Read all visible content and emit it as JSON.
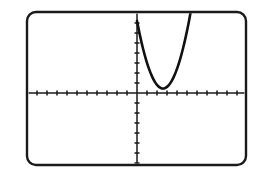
{
  "screen": {
    "device_label": "graphing-calculator-screen",
    "frame": {
      "x": 27,
      "y": 12,
      "width": 219,
      "height": 153,
      "corner_radius": 9,
      "border_color": "#1a1a1a",
      "background_color": "#ffffff"
    }
  },
  "chart_data": {
    "type": "line",
    "title": "",
    "subtitle": "",
    "xlabel": "",
    "ylabel": "",
    "grid": false,
    "legend": null,
    "tick_labels_shown": false,
    "axis_color": "#1a1a1a",
    "curve_color": "#111111",
    "origin_px": {
      "x": 137,
      "y": 93
    },
    "pixels_per_unit": {
      "x": 10.0,
      "y": 10.0
    },
    "xlim": [
      -11,
      11
    ],
    "ylim": [
      -7.2,
      8.1
    ],
    "x_ticks": [
      -10,
      -9,
      -8,
      -7,
      -6,
      -5,
      -4,
      -3,
      -2,
      -1,
      1,
      2,
      3,
      4,
      5,
      6,
      7,
      8,
      9,
      10
    ],
    "y_ticks": [
      -7,
      -6,
      -5,
      -4,
      -3,
      -2,
      -1,
      1,
      2,
      3,
      4,
      5,
      6,
      7,
      8
    ],
    "tick_length_px": 5,
    "series": [
      {
        "name": "parabola",
        "equation": "y = (x - 2.6)^2 + 0.45",
        "vertex": [
          2.6,
          0.45
        ],
        "opens": "up",
        "x": [
          0.0,
          0.3,
          0.6,
          0.9,
          1.2,
          1.5,
          1.8,
          2.1,
          2.4,
          2.6,
          2.8,
          3.1,
          3.4,
          3.7,
          4.0,
          4.3,
          4.6,
          4.9,
          5.2,
          5.5
        ],
        "values": [
          7.21,
          5.74,
          4.45,
          3.34,
          2.41,
          1.66,
          1.09,
          0.7,
          0.49,
          0.45,
          0.49,
          0.7,
          1.09,
          1.66,
          2.41,
          3.34,
          4.45,
          5.74,
          7.21,
          8.86
        ],
        "x_start": 0.0,
        "x_end": 5.5,
        "clipped_at_top": true
      }
    ]
  }
}
